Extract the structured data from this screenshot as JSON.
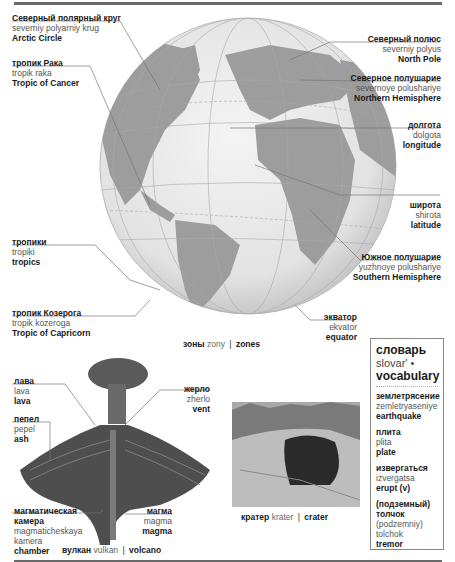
{
  "globe_labels": [
    {
      "id": "arctic-circle",
      "ru": "Северный полярный круг",
      "tr": "severniy polyarniy krug",
      "en": "Arctic Circle"
    },
    {
      "id": "tropic-of-cancer",
      "ru": "тропик Рака",
      "tr": "tropik raka",
      "en": "Tropic of Cancer"
    },
    {
      "id": "tropics",
      "ru": "тропики",
      "tr": "tropiki",
      "en": "tropics"
    },
    {
      "id": "tropic-of-capricorn",
      "ru": "тропик Козерога",
      "tr": "tropik kozeroga",
      "en": "Tropic of Capricorn"
    },
    {
      "id": "north-pole",
      "ru": "Северный полюс",
      "tr": "severniy polyus",
      "en": "North Pole"
    },
    {
      "id": "northern-hemisphere",
      "ru": "Северное полушарие",
      "tr": "severnoye polushariye",
      "en": "Northern Hemisphere"
    },
    {
      "id": "longitude",
      "ru": "долгота",
      "tr": "dolgota",
      "en": "longitude"
    },
    {
      "id": "latitude",
      "ru": "широта",
      "tr": "shirota",
      "en": "latitude"
    },
    {
      "id": "southern-hemisphere",
      "ru": "Южное полушарие",
      "tr": "yuzhnoye polushariye",
      "en": "Southern Hemisphere"
    },
    {
      "id": "equator",
      "ru": "экватор",
      "tr": "ekvator",
      "en": "equator"
    }
  ],
  "zones_caption": {
    "ru": "зоны",
    "tr": "zony",
    "sep": "|",
    "en": "zones"
  },
  "volcano_labels": [
    {
      "id": "lava",
      "ru": "лава",
      "tr": "lava",
      "en": "lava"
    },
    {
      "id": "ash",
      "ru": "пепел",
      "tr": "pepel",
      "en": "ash"
    },
    {
      "id": "vent",
      "ru": "жерло",
      "tr": "zherlo",
      "en": "vent"
    },
    {
      "id": "magma-chamber",
      "ru": "магматическая камера",
      "tr": "magmaticheskaya kamera",
      "en": "chamber"
    },
    {
      "id": "magma",
      "ru": "магма",
      "tr": "magma",
      "en": "magma"
    }
  ],
  "volcano_caption": {
    "ru": "вулкан",
    "tr": "vulkan",
    "sep": "|",
    "en": "volcano"
  },
  "crater_caption": {
    "ru": "кратер",
    "tr": "krater",
    "sep": "|",
    "en": "crater"
  },
  "vocabulary": {
    "title_ru": "словарь",
    "title_tr": "slovar' •",
    "title_en": "vocabulary",
    "entries": [
      {
        "ru": "землетрясение",
        "tr": "zemletryaseniye",
        "en": "earthquake"
      },
      {
        "ru": "плита",
        "tr": "plita",
        "en": "plate"
      },
      {
        "ru": "извергаться",
        "tr": "izvergatsa",
        "en": "erupt (v)"
      },
      {
        "ru": "(подземный) толчок",
        "tr": "(podzemniy) tolchok",
        "en": "tremor"
      }
    ]
  },
  "colors": {
    "ocean": "#e8e8e8",
    "land": "#9a9a9a",
    "rule": "#6a6a6a",
    "leader": "#777777"
  }
}
